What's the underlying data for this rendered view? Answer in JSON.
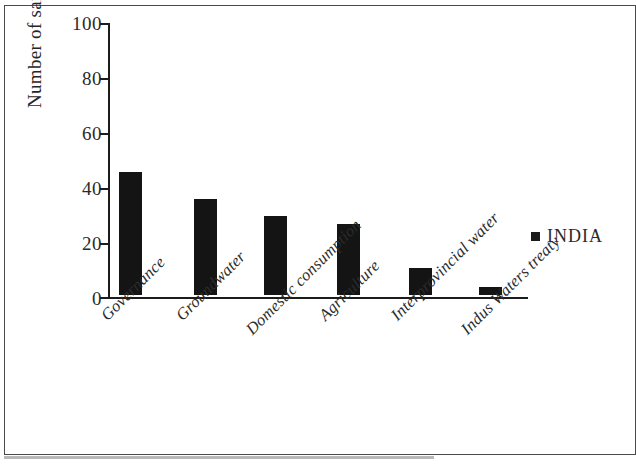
{
  "chart_data": {
    "type": "bar",
    "title": "",
    "subtitle": "",
    "xlabel": "",
    "ylabel": "Number of sample sets",
    "ylim": [
      0,
      100
    ],
    "yticks": [
      0,
      20,
      40,
      60,
      80,
      100
    ],
    "ytick_labels": [
      "0",
      "20",
      "40",
      "60",
      "80",
      "100"
    ],
    "grid": false,
    "legend_position": "right",
    "categories": [
      "Governance",
      "Groundwater",
      "Domestic consumption",
      "Agriculture",
      "Interprovincial water",
      "Indus Waters treaty"
    ],
    "series": [
      {
        "name": "INDIA",
        "color": "#141414",
        "values": [
          45,
          35,
          29,
          26,
          10,
          3
        ]
      }
    ]
  },
  "legend": {
    "entries": [
      {
        "label": "INDIA",
        "marker": "filled-square",
        "color": "#141414"
      }
    ]
  },
  "axes": {
    "y_title": "Number of sample sets",
    "tick_labels_y": [
      "100",
      "80",
      "60",
      "40",
      "20",
      "0"
    ],
    "tick_labels_x": [
      "Governance",
      "Groundwater",
      "Domestic consumption",
      "Agriculture",
      "Interprovincial water",
      "Indus Waters treaty"
    ]
  },
  "colors": {
    "bar": "#141414",
    "axis": "#1c1c1c",
    "frame": "#4a4a4a",
    "text": "#2a2a2a",
    "background": "#ffffff"
  }
}
